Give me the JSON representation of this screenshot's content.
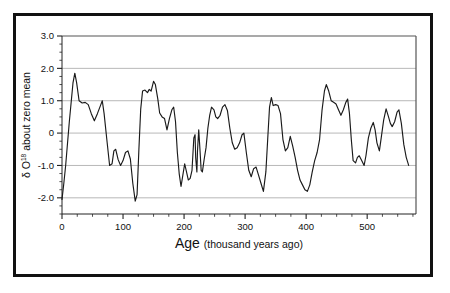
{
  "figure": {
    "frame_color": "#111111",
    "background": "#ffffff"
  },
  "chart_data": {
    "type": "line",
    "title": "",
    "subtitle": "",
    "xlabel_main": "Age",
    "xlabel_sub": "(thousand years ago)",
    "xlabel_full": "Age (thousand years ago)",
    "ylabel_prefix": "δ O",
    "ylabel_superscript": "18",
    "ylabel_suffix": " about zero mean",
    "ylabel_full": "δ O18 about zero mean",
    "xlim": [
      0,
      580
    ],
    "ylim": [
      -2.5,
      3.0
    ],
    "xticks": [
      0,
      100,
      200,
      300,
      400,
      500
    ],
    "xticklabels": [
      "0",
      "100",
      "200",
      "300",
      "400",
      "500"
    ],
    "x_minor_step": 25,
    "yticks": [
      -2.0,
      -1.0,
      0,
      1.0,
      2.0,
      3.0
    ],
    "yticklabels": [
      "-2.0",
      "-1.0",
      "0",
      "1.0",
      "2.0",
      "3.0"
    ],
    "y_minor_step": 0.25,
    "grid": true,
    "grid_axis": "y",
    "grid_color": "#9a9a9a",
    "legend": "none",
    "line_color": "#1a1a1a",
    "series": [
      {
        "name": "delta O-18 about zero mean",
        "points": [
          [
            0,
            -2.05
          ],
          [
            3,
            -1.55
          ],
          [
            6,
            -1.0
          ],
          [
            12,
            0.35
          ],
          [
            18,
            1.55
          ],
          [
            21,
            1.85
          ],
          [
            24,
            1.55
          ],
          [
            28,
            1.0
          ],
          [
            33,
            0.93
          ],
          [
            38,
            0.95
          ],
          [
            43,
            0.88
          ],
          [
            48,
            0.6
          ],
          [
            53,
            0.38
          ],
          [
            58,
            0.6
          ],
          [
            63,
            0.85
          ],
          [
            66,
            1.0
          ],
          [
            69,
            0.6
          ],
          [
            74,
            -0.3
          ],
          [
            78,
            -1.0
          ],
          [
            82,
            -0.95
          ],
          [
            85,
            -0.55
          ],
          [
            88,
            -0.5
          ],
          [
            92,
            -0.82
          ],
          [
            96,
            -1.0
          ],
          [
            100,
            -0.85
          ],
          [
            104,
            -0.6
          ],
          [
            108,
            -0.55
          ],
          [
            112,
            -0.8
          ],
          [
            116,
            -1.55
          ],
          [
            120,
            -2.1
          ],
          [
            123,
            -1.9
          ],
          [
            126,
            -0.5
          ],
          [
            129,
            0.75
          ],
          [
            132,
            1.3
          ],
          [
            136,
            1.33
          ],
          [
            140,
            1.25
          ],
          [
            143,
            1.35
          ],
          [
            146,
            1.3
          ],
          [
            150,
            1.6
          ],
          [
            153,
            1.5
          ],
          [
            157,
            1.05
          ],
          [
            160,
            0.62
          ],
          [
            164,
            0.5
          ],
          [
            168,
            0.45
          ],
          [
            172,
            0.1
          ],
          [
            176,
            0.45
          ],
          [
            180,
            0.72
          ],
          [
            183,
            0.8
          ],
          [
            186,
            0.35
          ],
          [
            189,
            -0.6
          ],
          [
            192,
            -1.25
          ],
          [
            195,
            -1.65
          ],
          [
            198,
            -1.3
          ],
          [
            201,
            -0.95
          ],
          [
            204,
            -1.2
          ],
          [
            207,
            -1.45
          ],
          [
            210,
            -1.4
          ],
          [
            213,
            -1.15
          ],
          [
            216,
            -0.15
          ],
          [
            218,
            -0.05
          ],
          [
            219,
            -0.75
          ],
          [
            221,
            -1.2
          ],
          [
            222,
            -0.55
          ],
          [
            224,
            0.1
          ],
          [
            226,
            -0.5
          ],
          [
            228,
            -1.15
          ],
          [
            230,
            -1.2
          ],
          [
            233,
            -0.8
          ],
          [
            236,
            -0.45
          ],
          [
            239,
            0.15
          ],
          [
            242,
            0.55
          ],
          [
            245,
            0.8
          ],
          [
            249,
            0.72
          ],
          [
            252,
            0.5
          ],
          [
            255,
            0.45
          ],
          [
            259,
            0.55
          ],
          [
            263,
            0.8
          ],
          [
            267,
            0.88
          ],
          [
            271,
            0.7
          ],
          [
            275,
            0.15
          ],
          [
            279,
            -0.3
          ],
          [
            283,
            -0.5
          ],
          [
            287,
            -0.45
          ],
          [
            291,
            -0.3
          ],
          [
            295,
            -0.05
          ],
          [
            298,
            0.0
          ],
          [
            302,
            -0.6
          ],
          [
            306,
            -1.15
          ],
          [
            310,
            -1.35
          ],
          [
            314,
            -1.1
          ],
          [
            318,
            -1.05
          ],
          [
            322,
            -1.3
          ],
          [
            326,
            -1.55
          ],
          [
            330,
            -1.8
          ],
          [
            334,
            -1.2
          ],
          [
            337,
            -0.2
          ],
          [
            340,
            0.8
          ],
          [
            343,
            1.1
          ],
          [
            346,
            0.85
          ],
          [
            350,
            0.88
          ],
          [
            354,
            0.85
          ],
          [
            358,
            0.6
          ],
          [
            362,
            -0.2
          ],
          [
            366,
            -0.55
          ],
          [
            370,
            -0.45
          ],
          [
            374,
            -0.1
          ],
          [
            378,
            -0.4
          ],
          [
            382,
            -0.75
          ],
          [
            386,
            -1.15
          ],
          [
            390,
            -1.45
          ],
          [
            394,
            -1.6
          ],
          [
            398,
            -1.75
          ],
          [
            402,
            -1.8
          ],
          [
            406,
            -1.6
          ],
          [
            410,
            -1.2
          ],
          [
            414,
            -0.85
          ],
          [
            418,
            -0.6
          ],
          [
            422,
            -0.2
          ],
          [
            426,
            0.7
          ],
          [
            430,
            1.3
          ],
          [
            433,
            1.5
          ],
          [
            437,
            1.3
          ],
          [
            441,
            1.0
          ],
          [
            445,
            0.95
          ],
          [
            449,
            0.9
          ],
          [
            453,
            0.72
          ],
          [
            457,
            0.55
          ],
          [
            461,
            0.72
          ],
          [
            465,
            0.95
          ],
          [
            468,
            1.05
          ],
          [
            471,
            0.6
          ],
          [
            474,
            -0.2
          ],
          [
            477,
            -0.85
          ],
          [
            481,
            -0.92
          ],
          [
            484,
            -0.75
          ],
          [
            487,
            -0.7
          ],
          [
            491,
            -0.85
          ],
          [
            495,
            -1.0
          ],
          [
            498,
            -0.7
          ],
          [
            502,
            -0.15
          ],
          [
            506,
            0.15
          ],
          [
            510,
            0.33
          ],
          [
            513,
            0.1
          ],
          [
            516,
            -0.3
          ],
          [
            520,
            -0.55
          ],
          [
            523,
            -0.15
          ],
          [
            527,
            0.4
          ],
          [
            531,
            0.75
          ],
          [
            535,
            0.5
          ],
          [
            538,
            0.3
          ],
          [
            541,
            0.2
          ],
          [
            545,
            0.35
          ],
          [
            549,
            0.65
          ],
          [
            552,
            0.72
          ],
          [
            556,
            0.3
          ],
          [
            560,
            -0.35
          ],
          [
            564,
            -0.75
          ],
          [
            568,
            -1.0
          ]
        ]
      }
    ]
  }
}
